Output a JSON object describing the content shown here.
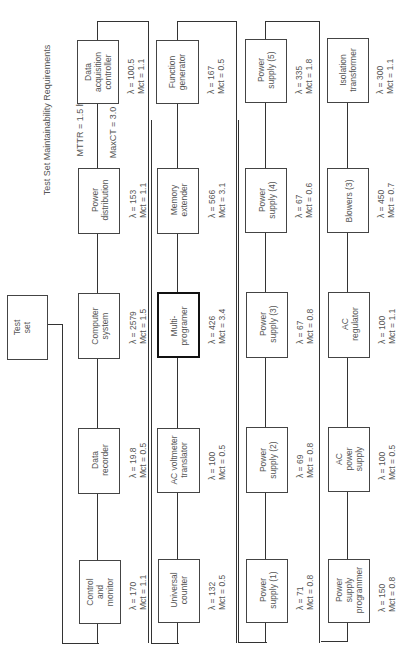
{
  "title": {
    "heading": "Test Set Maintainability Requirements",
    "mttr": "MTTR = 1.5 hours",
    "maxct": "MaxCT = 3.0 hours"
  },
  "root": {
    "label": "Test\nset"
  },
  "branches": [
    {
      "items": [
        {
          "label": "Control\nand\nmonitor",
          "lambda": "λ = 170",
          "mct": "Mct = 1.1"
        },
        {
          "label": "Data\nrecorder",
          "lambda": "λ = 19.8",
          "mct": "Mct = 0.5"
        },
        {
          "label": "Computer\nsystem",
          "lambda": "λ = 2579",
          "mct": "Mct = 1.5"
        },
        {
          "label": "Power\ndistribution",
          "lambda": "λ = 153",
          "mct": "Mct = 1.1"
        },
        {
          "label": "Data\nacquisition\ncontroller",
          "lambda": "λ = 100.5",
          "mct": "Mct = 1.1"
        }
      ]
    },
    {
      "items": [
        {
          "label": "Universal\ncounter",
          "lambda": "λ = 132",
          "mct": "Mct = 0.5"
        },
        {
          "label": "AC voltmeter\ntranslator",
          "lambda": "λ = 100",
          "mct": "Mct = 0.5"
        },
        {
          "label": "Multi-\nprogramer",
          "lambda": "λ = 426",
          "mct": "Mct = 3.4",
          "highlighted": true
        },
        {
          "label": "Memory\nextender",
          "lambda": "λ = 566",
          "mct": "Mct = 3.1"
        },
        {
          "label": "Function\ngenerator",
          "lambda": "λ = 167",
          "mct": "Mct = 0.5"
        }
      ]
    },
    {
      "items": [
        {
          "label": "Power\nsupply (1)",
          "lambda": "λ = 71",
          "mct": "Mct = 0.8"
        },
        {
          "label": "Power\nsupply (2)",
          "lambda": "λ = 69",
          "mct": "Mct = 0.8"
        },
        {
          "label": "Power\nsupply (3)",
          "lambda": "λ = 67",
          "mct": "Mct = 0.8"
        },
        {
          "label": "Power\nsupply (4)",
          "lambda": "λ = 67",
          "mct": "Mct = 0.6"
        },
        {
          "label": "Power\nsupply (5)",
          "lambda": "λ = 335",
          "mct": "Mct = 1.8"
        }
      ]
    },
    {
      "items": [
        {
          "label": "Power\nsupply\nprogrammer",
          "lambda": "λ = 150",
          "mct": "Mct = 0.8"
        },
        {
          "label": "AC\npower\nsupply",
          "lambda": "λ = 100",
          "mct": "Mct = 0.5"
        },
        {
          "label": "AC\nregulator",
          "lambda": "λ = 100",
          "mct": "Mct = 1.1"
        },
        {
          "label": "Blowers (3)",
          "lambda": "λ = 450",
          "mct": "Mct = 0.7"
        },
        {
          "label": "Isolation\ntransformer",
          "lambda": "λ = 300",
          "mct": "Mct = 1.1"
        }
      ]
    }
  ]
}
